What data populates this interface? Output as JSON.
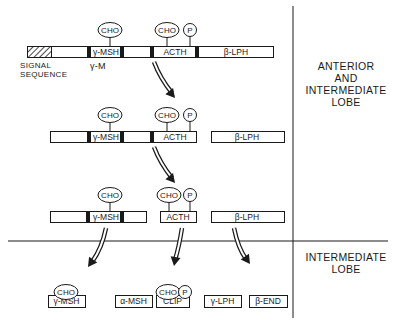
{
  "regions": {
    "anterior": {
      "lines": [
        "ANTERIOR",
        "AND",
        "INTERMEDIATE",
        "LOBE"
      ]
    },
    "intermediate": {
      "lines": [
        "INTERMEDIATE",
        "LOBE"
      ]
    }
  },
  "signal_label": {
    "lines": [
      "SIGNAL",
      "SEQUENCE"
    ]
  },
  "gamma_m_label": "γ-M",
  "labels": {
    "cho": "CHO",
    "p": "P",
    "gamma_msh": "γ-MSH",
    "acth": "ACTH",
    "beta_lph": "β-LPH",
    "alpha_msh": "α-MSH",
    "clip": "CLIP",
    "gamma_lph": "γ-LPH",
    "beta_end": "β-END"
  },
  "dividers": {
    "vertical": {
      "x": 293,
      "y1": 6,
      "y2": 318
    },
    "horizontal": {
      "x1": 8,
      "x2": 388,
      "y": 241
    }
  },
  "rows": [
    {
      "name": "row-precursor",
      "y": 46,
      "h": 11,
      "bars": [
        {
          "x": 27,
          "w": 246
        }
      ],
      "hatch": {
        "x": 27,
        "w": 24
      },
      "dark": [
        {
          "x": 87,
          "w": 4
        },
        {
          "x": 120,
          "w": 4
        },
        {
          "x": 150,
          "w": 4
        },
        {
          "x": 195,
          "w": 4
        }
      ],
      "texts": [
        {
          "key": "gamma_msh",
          "x": 106,
          "size": 8.5
        },
        {
          "key": "acth",
          "x": 175,
          "size": 8.5
        },
        {
          "key": "beta_lph",
          "x": 236,
          "size": 8.5
        }
      ],
      "cho": [
        {
          "x": 110,
          "cy": 30
        },
        {
          "x": 167,
          "cy": 30
        }
      ],
      "p": [
        {
          "x": 190,
          "cy": 30
        }
      ]
    },
    {
      "name": "row-intermediate-1",
      "y": 131,
      "h": 11,
      "bars": [
        {
          "x": 50,
          "w": 146
        },
        {
          "x": 211,
          "w": 73
        }
      ],
      "hatch": null,
      "dark": [
        {
          "x": 87,
          "w": 4
        },
        {
          "x": 120,
          "w": 4
        },
        {
          "x": 150,
          "w": 4
        }
      ],
      "texts": [
        {
          "key": "gamma_msh",
          "x": 106,
          "size": 8.5
        },
        {
          "key": "acth",
          "x": 175,
          "size": 8.5
        },
        {
          "key": "beta_lph",
          "x": 247,
          "size": 8.5
        }
      ],
      "cho": [
        {
          "x": 110,
          "cy": 115
        },
        {
          "x": 167,
          "cy": 115
        }
      ],
      "p": [
        {
          "x": 190,
          "cy": 115
        }
      ]
    },
    {
      "name": "row-intermediate-2",
      "y": 211,
      "h": 11,
      "bars": [
        {
          "x": 50,
          "w": 96
        },
        {
          "x": 160,
          "w": 36
        },
        {
          "x": 211,
          "w": 73
        }
      ],
      "hatch": null,
      "dark": [
        {
          "x": 86,
          "w": 4
        },
        {
          "x": 120,
          "w": 4
        }
      ],
      "texts": [
        {
          "key": "gamma_msh",
          "x": 106,
          "size": 8.5
        },
        {
          "key": "acth",
          "x": 178,
          "size": 8.5
        },
        {
          "key": "beta_lph",
          "x": 247,
          "size": 8.5
        }
      ],
      "cho": [
        {
          "x": 110,
          "cy": 195
        },
        {
          "x": 169,
          "cy": 195
        }
      ],
      "p": [
        {
          "x": 190,
          "cy": 195
        }
      ]
    }
  ],
  "products": {
    "y": 307,
    "h": 12,
    "boxes": [
      {
        "key": "gamma_msh",
        "x": 48,
        "w": 37
      },
      {
        "key": "alpha_msh",
        "x": 115,
        "w": 37
      },
      {
        "key": "clip",
        "x": 156,
        "w": 33
      },
      {
        "key": "gamma_lph",
        "x": 204,
        "w": 37
      },
      {
        "key": "beta_end",
        "x": 249,
        "w": 38
      }
    ],
    "cho": [
      {
        "x": 66,
        "cy": 292
      },
      {
        "x": 168,
        "cy": 292
      }
    ],
    "p": [
      {
        "x": 185,
        "cy": 292
      }
    ]
  },
  "arrows": [
    {
      "name": "arrow-row1-to-row2",
      "path": "M154 62 Q160 78 172 93",
      "tip": [
        175,
        98
      ],
      "angle": 50
    },
    {
      "name": "arrow-row2-to-row3",
      "path": "M154 147 Q160 163 172 178",
      "tip": [
        175,
        183
      ],
      "angle": 50
    },
    {
      "name": "arrow-gamma-msh",
      "path": "M106 228 Q102 248 92 262",
      "tip": [
        88,
        267
      ],
      "angle": 125
    },
    {
      "name": "arrow-acth",
      "path": "M182 228 Q179 247 175 260",
      "tip": [
        174,
        266
      ],
      "angle": 100
    },
    {
      "name": "arrow-beta-lph",
      "path": "M234 228 Q238 248 246 259",
      "tip": [
        250,
        264
      ],
      "angle": 55
    }
  ]
}
